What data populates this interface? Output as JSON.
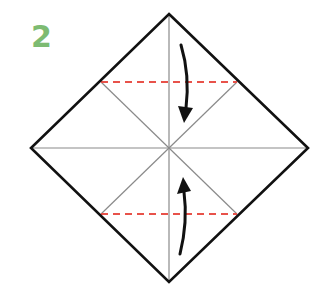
{
  "step": {
    "number": "2",
    "color": "#7dbb72"
  },
  "diagram": {
    "square_vertices": {
      "top": [
        169,
        14
      ],
      "right": [
        308,
        148
      ],
      "bottom": [
        169,
        282
      ],
      "left": [
        31,
        148
      ]
    },
    "center": [
      169,
      148
    ],
    "outline_color": "#111111",
    "crease_color": "#8a8a8a",
    "fold_line_color": "#e8524a",
    "fold_lines": [
      {
        "name": "top-valley-fold",
        "y": 82,
        "x1": 101,
        "x2": 237
      },
      {
        "name": "bottom-valley-fold",
        "y": 214,
        "x1": 101,
        "x2": 237
      }
    ],
    "arrows": [
      {
        "name": "fold-down-arrow",
        "direction": "down"
      },
      {
        "name": "fold-up-arrow",
        "direction": "up"
      }
    ]
  }
}
